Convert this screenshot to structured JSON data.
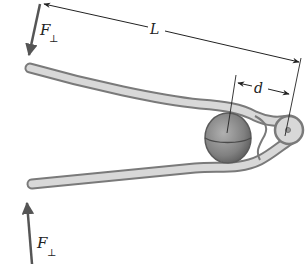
{
  "figure": {
    "labels": {
      "force_top": "F",
      "force_top_sub": "⊥",
      "force_bottom": "F",
      "force_bottom_sub": "⊥",
      "length": "L",
      "distance": "d"
    },
    "colors": {
      "arm_fill": "#d8d8d8",
      "arm_edge": "#7a7a7a",
      "nut_fill": "#8a8a8a",
      "nut_edge": "#5a5a5a",
      "arrow": "#555555",
      "dimension_line": "#222222",
      "background": "#ffffff"
    }
  }
}
